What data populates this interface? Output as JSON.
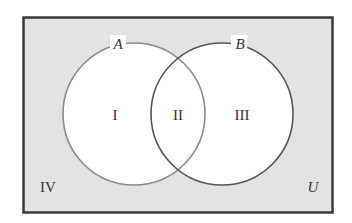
{
  "diagram": {
    "type": "venn",
    "universe_label": "U",
    "sets": [
      {
        "label": "A"
      },
      {
        "label": "B"
      }
    ],
    "regions": [
      {
        "label": "I",
        "description": "A only"
      },
      {
        "label": "II",
        "description": "A and B"
      },
      {
        "label": "III",
        "description": "B only"
      },
      {
        "label": "IV",
        "description": "neither A nor B"
      }
    ],
    "colors": {
      "universe_fill": "#e3e3e3",
      "circle_fill": "#ffffff",
      "border": "#3a3a3a",
      "circle_a_stroke": "#8a8a8a",
      "circle_b_stroke": "#555555"
    }
  }
}
